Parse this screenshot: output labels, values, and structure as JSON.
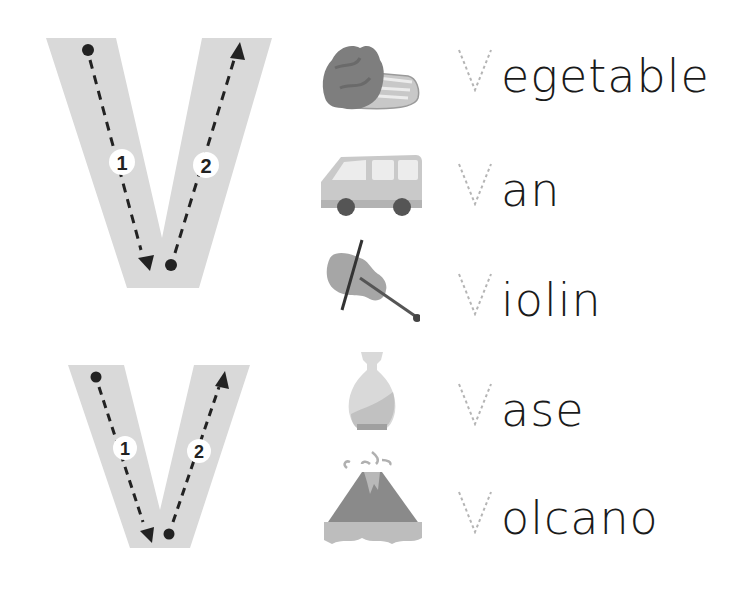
{
  "worksheet": {
    "letter": "V",
    "colors": {
      "letter_fill": "#d9d9d9",
      "guide_stroke": "#222222",
      "dotted_letter": "#b5b5b5",
      "word_text": "#1a1a1a"
    },
    "large_tracing": {
      "stroke_numbers": [
        "1",
        "2"
      ]
    },
    "small_tracing": {
      "stroke_numbers": [
        "1",
        "2"
      ]
    },
    "words": [
      {
        "first_letter": "V",
        "rest": "egetable",
        "full": "Vegetable",
        "picture": "vegetable-icon"
      },
      {
        "first_letter": "V",
        "rest": "an",
        "full": "Van",
        "picture": "van-icon"
      },
      {
        "first_letter": "V",
        "rest": "iolin",
        "full": "Violin",
        "picture": "violin-icon"
      },
      {
        "first_letter": "V",
        "rest": "ase",
        "full": "Vase",
        "picture": "vase-icon"
      },
      {
        "first_letter": "V",
        "rest": "olcano",
        "full": "Volcano",
        "picture": "volcano-icon"
      }
    ]
  }
}
